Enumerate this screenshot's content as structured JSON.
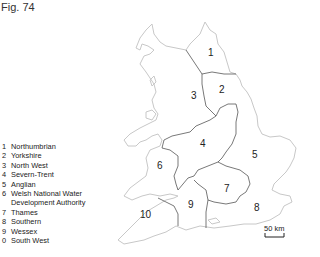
{
  "figure": {
    "title": "Fig. 74"
  },
  "legend": {
    "items": [
      {
        "num": "1",
        "label": "Northumbrian"
      },
      {
        "num": "2",
        "label": "Yorkshire"
      },
      {
        "num": "3",
        "label": "North West"
      },
      {
        "num": "4",
        "label": "Severn-Trent"
      },
      {
        "num": "5",
        "label": "Anglian"
      },
      {
        "num": "6",
        "label": "Welsh National Water",
        "label_cont": "Development Authority"
      },
      {
        "num": "7",
        "label": "Thames"
      },
      {
        "num": "8",
        "label": "Southern"
      },
      {
        "num": "9",
        "label": "Wessex"
      },
      {
        "num": "0",
        "label": "South West"
      }
    ]
  },
  "map": {
    "region_labels": [
      {
        "id": "1",
        "text": "1",
        "x": 208,
        "y": 57
      },
      {
        "id": "2",
        "text": "2",
        "x": 219,
        "y": 94
      },
      {
        "id": "3",
        "text": "3",
        "x": 191,
        "y": 100
      },
      {
        "id": "4",
        "text": "4",
        "x": 200,
        "y": 148
      },
      {
        "id": "5",
        "text": "5",
        "x": 252,
        "y": 159
      },
      {
        "id": "6",
        "text": "6",
        "x": 157,
        "y": 170
      },
      {
        "id": "7",
        "text": "7",
        "x": 224,
        "y": 193
      },
      {
        "id": "8",
        "text": "8",
        "x": 254,
        "y": 212
      },
      {
        "id": "9",
        "text": "9",
        "x": 188,
        "y": 209
      },
      {
        "id": "10",
        "text": "10",
        "x": 142,
        "y": 219
      }
    ],
    "scale_bar": {
      "label": "50 km"
    },
    "colors": {
      "coast": "#c8c8c8",
      "border": "#555555"
    }
  }
}
